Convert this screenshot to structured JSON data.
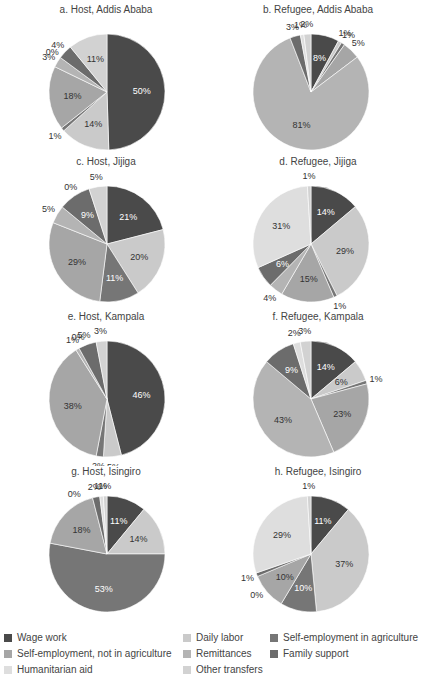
{
  "chart_data": [
    {
      "type": "pie",
      "title": "a. Host, Addis Ababa",
      "categories": [
        "Wage work",
        "Daily labor",
        "Self-employment in agriculture",
        "Self-employment, not in agriculture",
        "Remittances",
        "Family support",
        "Humanitarian aid",
        "Other transfers"
      ],
      "values": [
        50,
        14,
        1,
        18,
        3,
        4,
        0,
        11
      ]
    },
    {
      "type": "pie",
      "title": "b. Refugee, Addis Ababa",
      "categories": [
        "Wage work",
        "Daily labor",
        "Self-employment in agriculture",
        "Self-employment, not in agriculture",
        "Remittances",
        "Family support",
        "Humanitarian aid",
        "Other transfers"
      ],
      "values": [
        8,
        1,
        1,
        5,
        81,
        3,
        1,
        2
      ]
    },
    {
      "type": "pie",
      "title": "c. Host, Jijiga",
      "categories": [
        "Wage work",
        "Daily labor",
        "Self-employment in agriculture",
        "Self-employment, not in agriculture",
        "Remittances",
        "Family support",
        "Humanitarian aid",
        "Other transfers"
      ],
      "values": [
        21,
        20,
        11,
        29,
        5,
        9,
        0,
        5
      ]
    },
    {
      "type": "pie",
      "title": "d. Refugee, Jijiga",
      "categories": [
        "Wage work",
        "Daily labor",
        "Self-employment in agriculture",
        "Self-employment, not in agriculture",
        "Remittances",
        "Family support",
        "Humanitarian aid",
        "Other transfers"
      ],
      "values": [
        14,
        29,
        1,
        15,
        4,
        6,
        31,
        1
      ]
    },
    {
      "type": "pie",
      "title": "e. Host, Kampala",
      "categories": [
        "Wage work",
        "Daily labor",
        "Self-employment in agriculture",
        "Self-employment, not in agriculture",
        "Remittances",
        "Family support",
        "Humanitarian aid",
        "Other transfers"
      ],
      "values": [
        46,
        5,
        2,
        38,
        1,
        5,
        0,
        3
      ]
    },
    {
      "type": "pie",
      "title": "f. Refugee, Kampala",
      "categories": [
        "Wage work",
        "Daily labor",
        "Self-employment in agriculture",
        "Self-employment, not in agriculture",
        "Remittances",
        "Family support",
        "Humanitarian aid",
        "Other transfers"
      ],
      "values": [
        14,
        6,
        1,
        23,
        43,
        9,
        2,
        3
      ]
    },
    {
      "type": "pie",
      "title": "g. Host, Isingiro",
      "categories": [
        "Wage work",
        "Daily labor",
        "Self-employment in agriculture",
        "Self-employment, not in agriculture",
        "Remittances",
        "Family support",
        "Humanitarian aid",
        "Other transfers"
      ],
      "values": [
        11,
        14,
        53,
        18,
        0,
        2,
        1,
        1
      ]
    },
    {
      "type": "pie",
      "title": "h. Refugee, Isingiro",
      "categories": [
        "Wage work",
        "Daily labor",
        "Self-employment in agriculture",
        "Self-employment, not in agriculture",
        "Remittances",
        "Family support",
        "Humanitarian aid",
        "Other transfers"
      ],
      "values": [
        11,
        37,
        10,
        10,
        0,
        1,
        29,
        1
      ]
    }
  ],
  "legend": {
    "position": "bottom",
    "items": [
      {
        "label": "Wage work",
        "color": "#4a4a4a"
      },
      {
        "label": "Daily labor",
        "color": "#cacaca"
      },
      {
        "label": "Self-employment in agriculture",
        "color": "#767676"
      },
      {
        "label": "Self-employment, not in agriculture",
        "color": "#a6a6a6"
      },
      {
        "label": "Remittances",
        "color": "#b4b4b4"
      },
      {
        "label": "Family support",
        "color": "#6c6c6c"
      },
      {
        "label": "Humanitarian aid",
        "color": "#dedede"
      },
      {
        "label": "Other transfers",
        "color": "#d2d2d2"
      }
    ]
  }
}
